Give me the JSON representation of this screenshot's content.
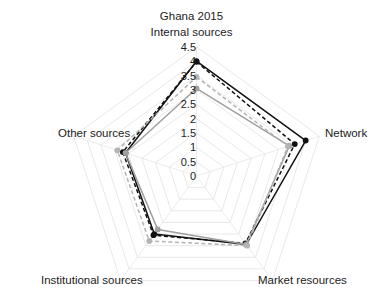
{
  "chart_data": {
    "type": "radar",
    "title": "Ghana 2015",
    "categories": [
      "Internal sources",
      "Network",
      "Market resources",
      "Institutional sources",
      "Other sources"
    ],
    "ticks": [
      "0",
      "0.5",
      "1",
      "1.5",
      "2",
      "2.5",
      "3",
      "3.5",
      "4",
      "4.5"
    ],
    "rlim": [
      0,
      4.5
    ],
    "rstep": 0.5,
    "grid": true,
    "legend": "none",
    "series": [
      {
        "name": "black-solid",
        "color": "#111111",
        "style": "solid",
        "values": [
          4.0,
          4.0,
          2.95,
          2.5,
          2.6
        ]
      },
      {
        "name": "black-dashed",
        "color": "#111111",
        "style": "dashed",
        "values": [
          3.98,
          3.6,
          2.9,
          2.55,
          2.7
        ]
      },
      {
        "name": "gray-solid",
        "color": "#a0a0a0",
        "style": "solid",
        "values": [
          3.05,
          3.4,
          2.95,
          2.3,
          2.6
        ]
      },
      {
        "name": "gray-dashed",
        "color": "#b4b4b4",
        "style": "dashed",
        "values": [
          3.45,
          3.35,
          3.0,
          2.8,
          2.9
        ]
      }
    ]
  },
  "labels": {
    "title": "Ghana 2015",
    "axis_top": "Internal sources",
    "axis_right": "Network",
    "axis_bottom_right": "Market resources",
    "axis_bottom_left": "Institutional sources",
    "axis_left": "Other sources"
  },
  "colors": {
    "background": "#ffffff",
    "text": "#1c1c1c",
    "grid": "#e2e2e2",
    "series_dark": "#111111",
    "series_light": "#a8a8a8"
  }
}
